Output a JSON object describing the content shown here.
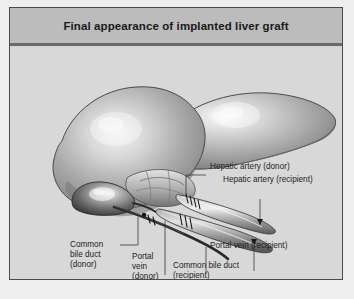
{
  "figure": {
    "title": "Final appearance of implanted liver graft",
    "background_color": "#d8d8d8",
    "panel_border_color": "#4a4a4a",
    "title_bar_color": "#bcbcbc",
    "title_rule_color": "#6a6a6a"
  },
  "labels": [
    {
      "id": "hepatic-artery-donor",
      "text": "Hepatic artery (donor)"
    },
    {
      "id": "hepatic-artery-recipient",
      "text": "Hepatic artery (recipient)"
    },
    {
      "id": "common-bile-duct-donor",
      "line1": "Common",
      "line2": "bile duct",
      "line3": "(donor)"
    },
    {
      "id": "portal-vein-donor",
      "line1": "Portal",
      "line2": "vein",
      "line3": "(donor)"
    },
    {
      "id": "portal-vein-recipient",
      "text": "Portal vein (recipient)"
    },
    {
      "id": "common-bile-duct-recipient",
      "line1": "Common bile duct",
      "line2": "(recipient)"
    }
  ],
  "anatomy": {
    "structures": [
      "liver-left-lobe",
      "liver-right-lobe",
      "gallbladder",
      "hepatic-artery",
      "portal-vein",
      "common-bile-duct",
      "anastomosis-sutures"
    ],
    "colors": {
      "liver_light": "#e8e8e8",
      "liver_mid": "#9b9b9b",
      "liver_dark": "#5e5e5e",
      "outline": "#3a3a3a",
      "gallbladder_dark": "#4e4e4e",
      "duct_dark": "#2b2b2b",
      "vessel_mid": "#8e8e8e"
    }
  }
}
